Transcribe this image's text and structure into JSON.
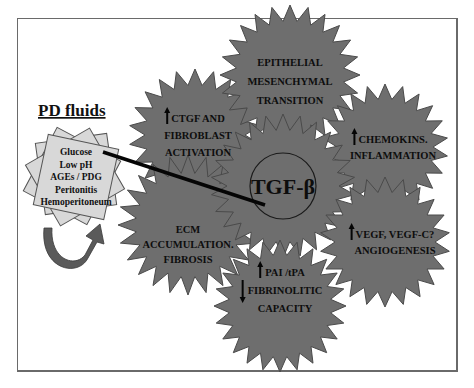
{
  "pd_fluids": {
    "title": "PD fluids",
    "factors": [
      "Glucose",
      "Low pH",
      "AGEs / PDG",
      "Peritonitis",
      "Hemoperitoneum"
    ]
  },
  "center": {
    "label": "TGF-β"
  },
  "effects": [
    {
      "id": "ctgf",
      "arrow": "up",
      "lines": [
        "CTGF AND",
        "FIBROBLAST",
        "ACTIVATION"
      ]
    },
    {
      "id": "emt",
      "arrow": "none",
      "lines": [
        "EPITHELIAL",
        "MESENCHYMAL",
        "TRANSITION"
      ]
    },
    {
      "id": "chemokins",
      "arrow": "up",
      "lines": [
        "CHEMOKINS.",
        "INFLAMMATION"
      ]
    },
    {
      "id": "ecm",
      "arrow": "none",
      "lines": [
        "ECM",
        "ACCUMULATION.",
        "FIBROSIS"
      ]
    },
    {
      "id": "vegf",
      "arrow": "up",
      "lines": [
        "VEGF, VEGF-C?",
        "ANGIOGENESIS"
      ]
    },
    {
      "id": "pai",
      "arrow": "mixed",
      "lines": [
        "PAI /tPA",
        "FIBRINOLITIC",
        "CAPACITY"
      ],
      "line_arrows": [
        "up",
        "down",
        "none"
      ]
    }
  ],
  "colors": {
    "burst_fill": "#6e6e6e",
    "paper_fill": "#d8d8d8",
    "text": "#0d0d0d"
  }
}
